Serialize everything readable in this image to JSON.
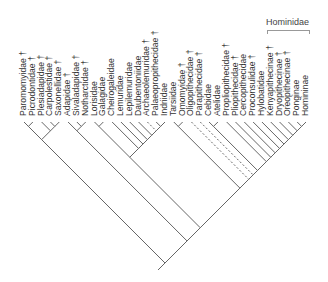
{
  "diagram": {
    "type": "cladogram",
    "group_label": "Hominidae",
    "extinct_marker": "†",
    "taxa": [
      {
        "name": "Paromomyidae",
        "extinct": true
      },
      {
        "name": "Picrodontidae",
        "extinct": true
      },
      {
        "name": "Plesiadapidae",
        "extinct": true
      },
      {
        "name": "Carpolestidae",
        "extinct": true
      },
      {
        "name": "Saxonellidae",
        "extinct": true
      },
      {
        "name": "Adapidae",
        "extinct": true
      },
      {
        "name": "Sivaladapidae",
        "extinct": true
      },
      {
        "name": "Notharctidae",
        "extinct": true
      },
      {
        "name": "Lorisidae",
        "extinct": false
      },
      {
        "name": "Galagidae",
        "extinct": false
      },
      {
        "name": "Cheirogaleidae",
        "extinct": false
      },
      {
        "name": "Lemuridae",
        "extinct": false
      },
      {
        "name": "Lepilemuridae",
        "extinct": false
      },
      {
        "name": "Daubentoniidae",
        "extinct": false
      },
      {
        "name": "Archaeolemuridae",
        "extinct": true
      },
      {
        "name": "Palaeopropithecidae",
        "extinct": true
      },
      {
        "name": "Indriidae",
        "extinct": false
      },
      {
        "name": "Tarsiidae",
        "extinct": false
      },
      {
        "name": "Omomyidae",
        "extinct": true
      },
      {
        "name": "Oligopithecidae",
        "extinct": true
      },
      {
        "name": "Parapithecidae",
        "extinct": true
      },
      {
        "name": "Cebidae",
        "extinct": false
      },
      {
        "name": "Atelidae",
        "extinct": false
      },
      {
        "name": "Propliopithecidae",
        "extinct": true
      },
      {
        "name": "Pliopithecidae",
        "extinct": true
      },
      {
        "name": "Cercopithecidae",
        "extinct": false
      },
      {
        "name": "Proconsulidae",
        "extinct": true
      },
      {
        "name": "Hylobatidae",
        "extinct": false
      },
      {
        "name": "Kenyapithecinae",
        "extinct": true
      },
      {
        "name": "Dryopithecinae",
        "extinct": true
      },
      {
        "name": "Oreopithecinae",
        "extinct": true
      },
      {
        "name": "Ponginae",
        "extinct": false
      },
      {
        "name": "Homininae",
        "extinct": false
      }
    ],
    "colors": {
      "line": "#555555",
      "text": "#333333",
      "bracket": "#999999"
    }
  }
}
